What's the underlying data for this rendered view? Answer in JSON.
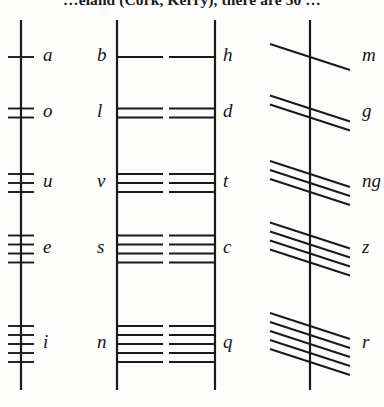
{
  "page": {
    "caption": "…eland (Cork, Kerry), there are 30 …",
    "ink_color": "#1a1a1a",
    "background_color": "#fdfdfb",
    "width": 384,
    "height": 407
  },
  "diagram": {
    "type": "ogham-alphabet-chart",
    "stem_top": 20,
    "stem_bottom": 390,
    "columns": [
      {
        "index": 1,
        "name": "vowels",
        "stem_x": 21,
        "stroke_style": "horizontal-crossing",
        "label_side": "right",
        "letters": [
          {
            "label": "a",
            "strokes": 1,
            "y": 57
          },
          {
            "label": "o",
            "strokes": 2,
            "y": 113
          },
          {
            "label": "u",
            "strokes": 3,
            "y": 183
          },
          {
            "label": "e",
            "strokes": 4,
            "y": 249
          },
          {
            "label": "i",
            "strokes": 5,
            "y": 344
          }
        ]
      },
      {
        "index": 2,
        "name": "b-group",
        "stem_x": 117,
        "stroke_style": "horizontal-right",
        "label_side": "left",
        "letters": [
          {
            "label": "b",
            "strokes": 1,
            "y": 57
          },
          {
            "label": "l",
            "strokes": 2,
            "y": 113
          },
          {
            "label": "v",
            "strokes": 3,
            "y": 183
          },
          {
            "label": "s",
            "strokes": 4,
            "y": 249
          },
          {
            "label": "n",
            "strokes": 5,
            "y": 344
          }
        ]
      },
      {
        "index": 3,
        "name": "h-group",
        "stem_x": 215,
        "stroke_style": "horizontal-left",
        "label_side": "right",
        "letters": [
          {
            "label": "h",
            "strokes": 1,
            "y": 57
          },
          {
            "label": "d",
            "strokes": 2,
            "y": 113
          },
          {
            "label": "t",
            "strokes": 3,
            "y": 183
          },
          {
            "label": "c",
            "strokes": 4,
            "y": 249
          },
          {
            "label": "q",
            "strokes": 5,
            "y": 344
          }
        ]
      },
      {
        "index": 4,
        "name": "m-group",
        "stem_x": 310,
        "stroke_style": "diagonal-crossing",
        "label_side": "right",
        "letters": [
          {
            "label": "m",
            "strokes": 1,
            "y": 57
          },
          {
            "label": "g",
            "strokes": 2,
            "y": 113
          },
          {
            "label": "ng",
            "strokes": 3,
            "y": 183
          },
          {
            "label": "z",
            "strokes": 4,
            "y": 249
          },
          {
            "label": "r",
            "strokes": 5,
            "y": 344
          }
        ]
      }
    ]
  }
}
